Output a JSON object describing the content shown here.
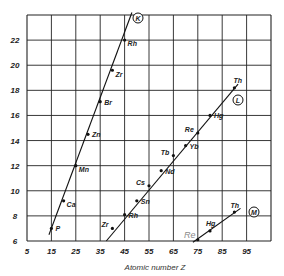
{
  "chart_data": {
    "type": "line",
    "title": "",
    "xlabel": "Atomic number Z",
    "ylabel": "",
    "xlim": [
      5,
      105
    ],
    "ylim": [
      6,
      24
    ],
    "x_ticks": [
      5,
      15,
      25,
      35,
      45,
      55,
      65,
      75,
      85,
      95
    ],
    "y_ticks": [
      6,
      8,
      10,
      12,
      14,
      16,
      18,
      20,
      22
    ],
    "grid": true,
    "legend": "none (series marked by circled letters)",
    "series": [
      {
        "name": "K",
        "points": [
          {
            "label": "P",
            "x": 15,
            "y": 7.0
          },
          {
            "label": "Ca",
            "x": 20,
            "y": 9.2
          },
          {
            "label": "Mn",
            "x": 25,
            "y": 12.0
          },
          {
            "label": "Zn",
            "x": 30,
            "y": 14.5
          },
          {
            "label": "Br",
            "x": 35,
            "y": 17.1
          },
          {
            "label": "Zr",
            "x": 40,
            "y": 19.6
          },
          {
            "label": "Rh",
            "x": 45,
            "y": 22.0
          }
        ]
      },
      {
        "name": "L",
        "points": [
          {
            "label": "Zr",
            "x": 40,
            "y": 7.0
          },
          {
            "label": "Rh",
            "x": 45,
            "y": 8.1
          },
          {
            "label": "Sn",
            "x": 50,
            "y": 9.2
          },
          {
            "label": "Cs",
            "x": 55,
            "y": 10.4
          },
          {
            "label": "Nd",
            "x": 60,
            "y": 11.6
          },
          {
            "label": "Tb",
            "x": 65,
            "y": 12.8
          },
          {
            "label": "Yb",
            "x": 70,
            "y": 13.6
          },
          {
            "label": "Re",
            "x": 75,
            "y": 14.6
          },
          {
            "label": "Hg",
            "x": 80,
            "y": 16.0
          },
          {
            "label": "Th",
            "x": 90,
            "y": 18.2
          }
        ]
      },
      {
        "name": "M",
        "points": [
          {
            "label": "Re",
            "x": 75,
            "y": 6.1
          },
          {
            "label": "Hg",
            "x": 80,
            "y": 6.8
          },
          {
            "label": "Th",
            "x": 90,
            "y": 8.3
          }
        ]
      }
    ],
    "annotations": [
      {
        "text": "K",
        "style": "circled",
        "near_series": "K"
      },
      {
        "text": "L",
        "style": "circled",
        "near_series": "L"
      },
      {
        "text": "M",
        "style": "circled",
        "near_series": "M"
      },
      {
        "text": "Re",
        "style": "grey-italic",
        "near_series": "M"
      }
    ]
  },
  "labels": {
    "xlabel": "Atomic number Z",
    "ghost_re": "Re",
    "circle_k": "K",
    "circle_l": "L",
    "circle_m": "M"
  }
}
